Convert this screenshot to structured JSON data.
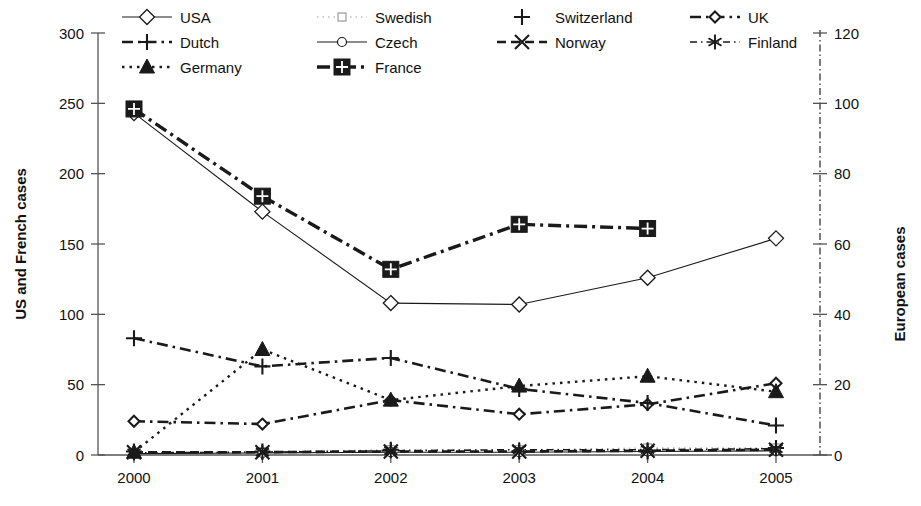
{
  "chart_data": {
    "type": "line",
    "title": "",
    "xlabel": "",
    "categories": [
      "2000",
      "2001",
      "2002",
      "2003",
      "2004",
      "2005"
    ],
    "x": [
      2000,
      2001,
      2002,
      2003,
      2004,
      2005
    ],
    "grid": false,
    "legend_position": "top",
    "axes": {
      "left": {
        "label": "US and French cases",
        "ticks": [
          0,
          50,
          100,
          150,
          200,
          250,
          300
        ],
        "tick_labels": [
          "0",
          "50",
          "100",
          "150",
          "200",
          "250",
          "300"
        ],
        "lim": [
          0,
          300
        ]
      },
      "right": {
        "label": "European cases",
        "ticks": [
          0,
          20,
          40,
          60,
          80,
          100,
          120
        ],
        "tick_labels": [
          "0",
          "20",
          "40",
          "60",
          "80",
          "100",
          "120"
        ],
        "lim": [
          0,
          120
        ]
      }
    },
    "series": [
      {
        "name": "USA",
        "axis": "left",
        "marker": "diamond-open",
        "line": "solid-thin",
        "values": [
          243,
          173,
          108,
          107,
          126,
          154
        ]
      },
      {
        "name": "Swedish",
        "axis": "right",
        "marker": "square-open",
        "line": "dotted-light",
        "values": [
          0.5,
          1,
          1.5,
          1.5,
          2,
          2
        ]
      },
      {
        "name": "Switzerland",
        "axis": "right",
        "marker": "plus",
        "line": "none",
        "values": [
          1,
          1,
          1.5,
          1,
          1,
          2
        ]
      },
      {
        "name": "UK",
        "axis": "left",
        "marker": "diamond-small",
        "line": "dashdot-thick",
        "values": [
          24,
          22,
          39,
          29,
          36,
          51
        ]
      },
      {
        "name": "Dutch",
        "axis": "left",
        "marker": "plus",
        "line": "dashdot-thick",
        "values": [
          83,
          63,
          69,
          47,
          37,
          21
        ]
      },
      {
        "name": "Czech",
        "axis": "right",
        "marker": "circle-open",
        "line": "solid-thin",
        "values": [
          0.4,
          0.6,
          0.8,
          0.8,
          1,
          1.2
        ]
      },
      {
        "name": "Norway",
        "axis": "right",
        "marker": "cross-x",
        "line": "dash-thick",
        "values": [
          0.8,
          0.8,
          1,
          1,
          1.2,
          1.5
        ]
      },
      {
        "name": "Finland",
        "axis": "right",
        "marker": "asterisk",
        "line": "dashdot-thin",
        "values": [
          0.6,
          0.8,
          1.2,
          1.5,
          1.5,
          1.8
        ]
      },
      {
        "name": "Germany",
        "axis": "left",
        "marker": "triangle-fill",
        "line": "dotted-thick",
        "values": [
          2,
          75,
          39,
          49,
          56,
          45
        ]
      },
      {
        "name": "France",
        "axis": "left",
        "marker": "square-fill",
        "line": "dashdot-heavy",
        "values": [
          246,
          184,
          132,
          164,
          161,
          null
        ]
      }
    ]
  },
  "legend": {
    "items": [
      {
        "label": "USA"
      },
      {
        "label": "Swedish"
      },
      {
        "label": "Switzerland"
      },
      {
        "label": "UK"
      },
      {
        "label": "Dutch"
      },
      {
        "label": "Czech"
      },
      {
        "label": "Norway"
      },
      {
        "label": "Finland"
      },
      {
        "label": "Germany"
      },
      {
        "label": "France"
      }
    ]
  },
  "colors": {
    "ink": "#1a1a1a",
    "axis": "#555555",
    "light": "#9a9a9a"
  }
}
